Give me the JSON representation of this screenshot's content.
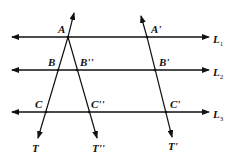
{
  "diagram": {
    "parallel_lines": [
      {
        "name": "L",
        "sub": "1",
        "y": 37
      },
      {
        "name": "L",
        "sub": "2",
        "y": 70
      },
      {
        "name": "L",
        "sub": "3",
        "y": 112
      }
    ],
    "points": {
      "A": "A",
      "B": "B",
      "B2": "B''",
      "C": "C",
      "C2": "C''",
      "A1": "A'",
      "B1": "B'",
      "C1": "C'",
      "T": "T",
      "T2": "T''",
      "T1": "T'"
    }
  }
}
